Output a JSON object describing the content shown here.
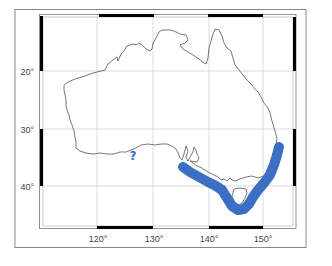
{
  "map": {
    "region": "Australia",
    "colors": {
      "background": "#ffffff",
      "outer_border": "#888888",
      "frame_black": "#000000",
      "frame_white": "#ffffff",
      "gridline": "#bfbfbf",
      "coastline": "#555555",
      "highlight_band": "#3a6fc4",
      "tick_label": "#444444"
    },
    "longitude_ticks": [
      {
        "value": 120,
        "label": "120°"
      },
      {
        "value": 130,
        "label": "130°"
      },
      {
        "value": 140,
        "label": "140°"
      },
      {
        "value": 150,
        "label": "150°"
      }
    ],
    "latitude_ticks": [
      {
        "value": 20,
        "label": "20°"
      },
      {
        "value": 30,
        "label": "30°"
      },
      {
        "value": 40,
        "label": "40°"
      }
    ],
    "annotation": {
      "symbol": "?",
      "description": "question-mark-annotation"
    },
    "highlight_band": {
      "description": "southeast-australia-coastal-band"
    }
  }
}
